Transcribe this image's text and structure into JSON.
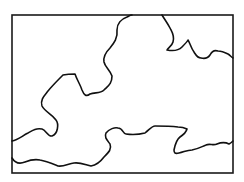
{
  "figure": {
    "type": "outline-map",
    "frame": {
      "x": 12,
      "y": 15,
      "width": 221,
      "height": 158,
      "stroke": "#1a1a1a"
    },
    "boundaries": [
      {
        "name": "upper-boundary",
        "stroke": "#111111",
        "path": "M12,141 C18,140 22,136 28,133 C33,130 36,128 42,129 C46,130 48,137 52,136 C58,134 59,124 56,120 C52,114 45,112 42,106 C40,100 44,96 48,91 C52,86 58,80 63,75 C68,74 72,74 75,74 C77,80 80,84 82,90 C84,95 86,97 90,94 C95,92 100,94 104,90 C108,86 112,84 112,76 C110,70 105,67 104,62 C103,56 106,52 110,48 C114,43 118,38 117,30 C117,24 121,19 127,17 C129,16 130,15 132,15"
      },
      {
        "name": "upper-right-boundary",
        "stroke": "#111111",
        "path": "M162,15 C165,20 168,24 170,28 C172,32 175,36 173,42 C172,46 168,48 167,50 C172,51 178,51 182,47 C185,44 187,42 188,40 C190,43 191,48 194,52 C196,55 197,58 201,58 C205,59 208,58 210,55 C212,51 215,50 218,51 C222,51 224,52 228,54 C230,55 231,57 233,58"
      },
      {
        "name": "lower-boundary",
        "stroke": "#111111",
        "path": "M12,158 C15,163 20,164 25,162 C30,160 35,159 40,160 C46,161 53,164 58,166 C63,167 68,164 74,163 C80,162 86,165 91,166 C97,165 101,161 104,157 C109,152 112,149 110,144 C107,140 104,137 106,133 C109,129 115,127 118,128 C123,128 123,134 126,134 C133,135 141,134 145,133 C150,129 152,126 155,126 C163,126 170,126 178,127 C183,127 185,128 187,129 C186,133 183,135 180,137 C176,140 175,145 174,150 C174,153 175,154 179,153 C184,152 187,150 192,150 C198,149 201,147 206,145 C210,143 213,146 217,144 C222,142 225,142 229,144 C231,143 232,142 233,141"
      }
    ]
  }
}
